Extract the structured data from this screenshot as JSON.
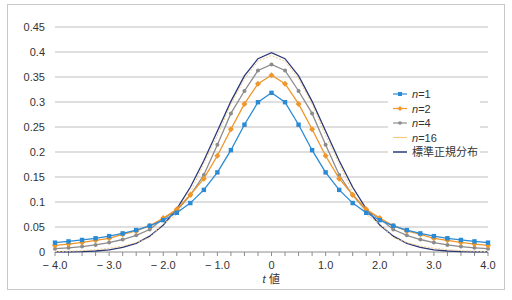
{
  "chart_data": {
    "type": "line",
    "title": "",
    "xlabel": "t 値",
    "ylabel": "",
    "xlim": [
      -4.0,
      4.0
    ],
    "ylim": [
      0,
      0.45
    ],
    "grid": true,
    "legend_position": "right",
    "y_ticks": [
      "0",
      "0.05",
      "0.1",
      "0.15",
      "0.2",
      "0.25",
      "0.3",
      "0.35",
      "0.4",
      "0.45"
    ],
    "x_ticks": [
      "− 4.0",
      "− 3.0",
      "− 2.0",
      "− 1.0",
      "0",
      "1.0",
      "2.0",
      "3.0",
      "4.0"
    ],
    "x": [
      -4.0,
      -3.75,
      -3.5,
      -3.25,
      -3.0,
      -2.75,
      -2.5,
      -2.25,
      -2.0,
      -1.75,
      -1.5,
      -1.25,
      -1.0,
      -0.75,
      -0.5,
      -0.25,
      0.0,
      0.25,
      0.5,
      0.75,
      1.0,
      1.25,
      1.5,
      1.75,
      2.0,
      2.25,
      2.5,
      2.75,
      3.0,
      3.25,
      3.5,
      3.75,
      4.0
    ],
    "series": [
      {
        "name": "n=1",
        "color": "#2a8ad4",
        "marker": "square",
        "values": [
          0.0187,
          0.0212,
          0.0241,
          0.0275,
          0.0318,
          0.0372,
          0.0439,
          0.0524,
          0.0637,
          0.0784,
          0.0979,
          0.1242,
          0.1592,
          0.2037,
          0.2546,
          0.2996,
          0.3183,
          0.2996,
          0.2546,
          0.2037,
          0.1592,
          0.1242,
          0.0979,
          0.0784,
          0.0637,
          0.0524,
          0.0439,
          0.0372,
          0.0318,
          0.0275,
          0.0241,
          0.0212,
          0.0187
        ]
      },
      {
        "name": "n=2",
        "color": "#f0962a",
        "marker": "diamond",
        "values": [
          0.0131,
          0.0158,
          0.0192,
          0.0235,
          0.0274,
          0.0353,
          0.0422,
          0.0526,
          0.068,
          0.0857,
          0.1143,
          0.1467,
          0.1925,
          0.2456,
          0.2962,
          0.3366,
          0.3536,
          0.3366,
          0.2962,
          0.2456,
          0.1925,
          0.1467,
          0.1143,
          0.0857,
          0.068,
          0.0526,
          0.0422,
          0.0353,
          0.0274,
          0.0235,
          0.0192,
          0.0158,
          0.0131
        ]
      },
      {
        "name": "n=4",
        "color": "#8c8c8c",
        "marker": "circle",
        "values": [
          0.0066,
          0.0085,
          0.0109,
          0.0142,
          0.0188,
          0.025,
          0.0334,
          0.045,
          0.0663,
          0.0837,
          0.1134,
          0.154,
          0.2147,
          0.2772,
          0.322,
          0.363,
          0.375,
          0.363,
          0.322,
          0.2772,
          0.2147,
          0.154,
          0.1134,
          0.0837,
          0.0663,
          0.045,
          0.0334,
          0.025,
          0.0188,
          0.0142,
          0.0109,
          0.0085,
          0.0066
        ]
      },
      {
        "name": "n=16",
        "color": "#f5c880",
        "marker": "none",
        "values": [
          0.001,
          0.0017,
          0.0028,
          0.0046,
          0.0075,
          0.012,
          0.0188,
          0.0289,
          0.0564,
          0.075,
          0.1188,
          0.1768,
          0.2327,
          0.296,
          0.3457,
          0.3816,
          0.393,
          0.3816,
          0.3457,
          0.296,
          0.2327,
          0.1768,
          0.1188,
          0.075,
          0.0564,
          0.0289,
          0.0188,
          0.012,
          0.0075,
          0.0046,
          0.0028,
          0.0017,
          0.001
        ]
      },
      {
        "name": "標準正規分布",
        "color": "#2b3a78",
        "marker": "none",
        "values": [
          0.0001,
          0.0004,
          0.0009,
          0.002,
          0.0044,
          0.0091,
          0.0175,
          0.0317,
          0.054,
          0.0863,
          0.1295,
          0.1826,
          0.242,
          0.3011,
          0.3521,
          0.3867,
          0.3989,
          0.3867,
          0.3521,
          0.3011,
          0.242,
          0.1826,
          0.1295,
          0.0863,
          0.054,
          0.0317,
          0.0175,
          0.0091,
          0.0044,
          0.002,
          0.0009,
          0.0004,
          0.0001
        ]
      }
    ]
  },
  "legend": {
    "items": [
      {
        "prefix": "n",
        "suffix": "=1"
      },
      {
        "prefix": "n",
        "suffix": "=2"
      },
      {
        "prefix": "n",
        "suffix": "=4"
      },
      {
        "prefix": "n",
        "suffix": "=16"
      },
      {
        "prefix": "",
        "suffix": "標準正規分布"
      }
    ]
  },
  "axis": {
    "xlabel_italic": "t",
    "xlabel_rest": " 値"
  }
}
